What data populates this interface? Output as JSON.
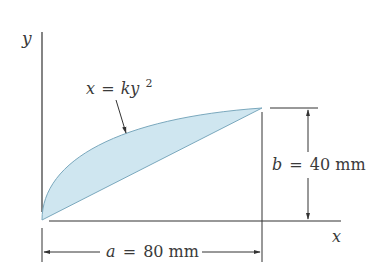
{
  "figure": {
    "axes": {
      "x_label": "x",
      "y_label": "y"
    },
    "curve": {
      "equation_lhs": "x",
      "equation_eq": "=",
      "equation_rhs_base": "ky",
      "equation_exp": "2"
    },
    "dimensions": {
      "width": {
        "symbol": "a",
        "eq": "=",
        "value": "80 mm"
      },
      "height": {
        "symbol": "b",
        "eq": "=",
        "value": "40 mm"
      }
    },
    "colors": {
      "fill": "#cfe6f0",
      "stroke": "#7aa8bd",
      "line": "#333333"
    }
  }
}
